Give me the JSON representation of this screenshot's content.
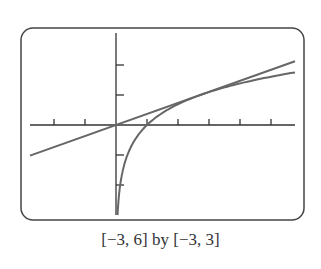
{
  "caption": "[−3, 6] by [−3, 3]",
  "chart_data": {
    "type": "line",
    "title": "",
    "xlabel": "",
    "ylabel": "",
    "xlim": [
      -3,
      6
    ],
    "ylim": [
      -3,
      3
    ],
    "xticks": [
      -2,
      -1,
      1,
      2,
      3,
      4,
      5
    ],
    "yticks": [
      -2,
      -1,
      1,
      2
    ],
    "grid": false,
    "series": [
      {
        "name": "y = ln x",
        "function": "ln(x)"
      },
      {
        "name": "tangent y = x/e",
        "function": "x/e"
      }
    ],
    "colors": {
      "curve": "#666666",
      "axes": "#333333",
      "frame": "#444444"
    }
  }
}
